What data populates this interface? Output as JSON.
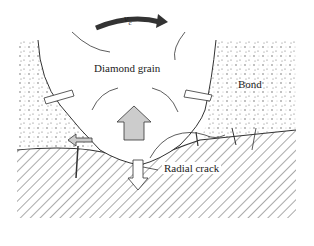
{
  "diagram": {
    "labels": {
      "velocity": "v",
      "velocity_subscript": "c",
      "grain": "Diamond grain",
      "bond": "Bond",
      "crack": "Radial crack"
    },
    "colors": {
      "rotation_arrow": "#333333",
      "grain_fill": "#ffffff",
      "bond_dots": "#555555",
      "workpiece_hatch": "#555555",
      "force_arrow_fill": "#cccccc",
      "outline": "#333333"
    }
  }
}
